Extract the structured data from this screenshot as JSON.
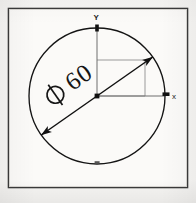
{
  "drawing": {
    "title": "Circle with diameter dimension",
    "frame": {
      "stroke_color": "#3a3a3a",
      "fill_color": "#fbfaf8"
    },
    "background_color": "#f6f5f3",
    "line_color": "#1a1a1a",
    "construction_line_color": "#8f8f8f",
    "circle": {
      "label": "circle",
      "center_x": 97,
      "center_y": 96,
      "radius": 68
    },
    "axes": {
      "x_label": "x",
      "y_label": "Y",
      "origin_marker": "origin-dot"
    },
    "dimension": {
      "symbol": "Ø",
      "value": "60",
      "full_text": "Ø 60",
      "angle_degrees": -35,
      "arrowheads": 2,
      "type": "diameter"
    },
    "construction_square": {
      "label": "quadrant-construction-square",
      "width": 48,
      "height": 36
    }
  },
  "caption": {
    "text": "—"
  }
}
